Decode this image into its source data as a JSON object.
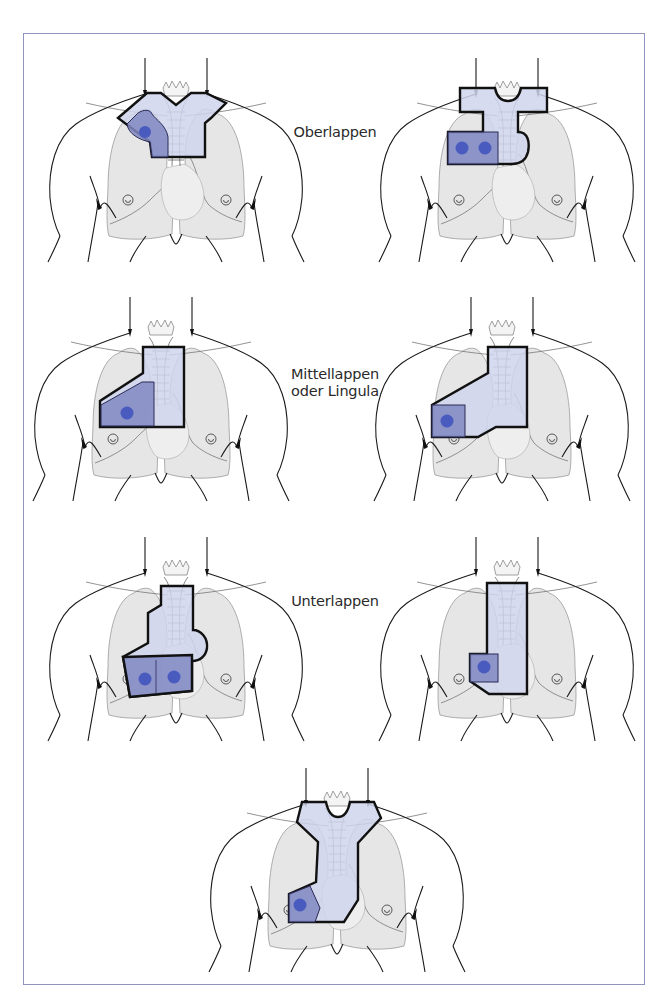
{
  "figure": {
    "border_color": "#8e94bd",
    "field_light_color": "#cfd5ec",
    "field_dark_color": "#8088c2",
    "dot_color": "#4a5bc0"
  },
  "labels": {
    "upper": "Oberlappen",
    "middle_line1": "Mittellappen",
    "middle_line2": "oder Lingula",
    "lower": "Unterlappen"
  },
  "rows": [
    {
      "label_key": "upper",
      "figures": [
        "right-upper-lobe-field",
        "left-upper-lobe-field"
      ]
    },
    {
      "label_key": "middle",
      "figures": [
        "right-middle-lobe-field",
        "lingula-field"
      ]
    },
    {
      "label_key": "lower",
      "figures": [
        "right-lower-lobe-field-bilateral",
        "left-lower-lobe-field"
      ]
    },
    {
      "label_key": null,
      "figures": [
        "right-lower-lobe-field-single"
      ]
    }
  ]
}
